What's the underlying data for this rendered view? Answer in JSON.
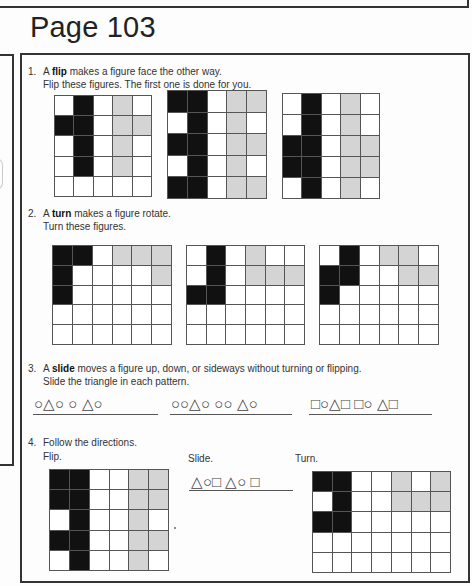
{
  "page_title": "Page 103",
  "questions": [
    {
      "number": "1.",
      "lines": [
        {
          "pre": "A ",
          "bold": "flip",
          "post": " makes a figure face the other way."
        },
        {
          "pre": "Flip these figures. The first one is done for you.",
          "bold": "",
          "post": ""
        }
      ],
      "grids": [
        {
          "rows": [
            "WBWGW",
            "BBWGG",
            "WBWGW",
            "WBWGW",
            "WWWWW"
          ]
        },
        {
          "rows": [
            "BBWGG",
            "WBWGW",
            "BBWGG",
            "WBWGW",
            "BBWGG"
          ]
        },
        {
          "rows": [
            "WBWGW",
            "WBWGW",
            "BBWGG",
            "BBWGG",
            "WBWGW"
          ]
        }
      ]
    },
    {
      "number": "2.",
      "lines": [
        {
          "pre": "A ",
          "bold": "turn",
          "post": " makes a figure rotate."
        },
        {
          "pre": "Turn these figures.",
          "bold": "",
          "post": ""
        }
      ],
      "grids": [
        {
          "rows": [
            "BBWGGG",
            "BWWWWG",
            "BWWWWW",
            "WWWWWW",
            "WWWWWW"
          ]
        },
        {
          "rows": [
            "WBWGWW",
            "WBWGGG",
            "BBWWWW",
            "WWWWWW",
            "WWWWWW"
          ]
        },
        {
          "rows": [
            "WBWGGW",
            "BBWWGG",
            "BWWWWW",
            "WWWWWW",
            "WWWWWW"
          ]
        }
      ]
    },
    {
      "number": "3.",
      "lines": [
        {
          "pre": "A ",
          "bold": "slide",
          "post": " moves a figure up, down, or sideways without turning or flipping."
        },
        {
          "pre": "Slide the triangle in each pattern.",
          "bold": "",
          "post": ""
        }
      ],
      "patterns": [
        "○△○   ○  △○",
        "○○△○ ○○  △○",
        "□○△□ □○ △□"
      ]
    },
    {
      "number": "4.",
      "lines": [
        {
          "pre": "Follow the directions.",
          "bold": "",
          "post": ""
        }
      ],
      "parts": [
        {
          "label": "Flip.",
          "rows": [
            "BBWWGG",
            "BBWWGG",
            "WBWWGW",
            "BBWWGG",
            "WBWWGW"
          ]
        },
        {
          "label": "Slide.",
          "pattern": "△○□ △○  □"
        },
        {
          "label": "Turn.",
          "rows": [
            "BBWWGWG",
            "WBWWGGG",
            "BBWWWWW",
            "WWWWWWW",
            "WWWWWWW"
          ]
        }
      ]
    }
  ],
  "colors": {
    "black_cell": "#111111",
    "gray_cell": "#d4d4d4",
    "white_cell": "#ffffff",
    "grid_line": "#555555"
  }
}
